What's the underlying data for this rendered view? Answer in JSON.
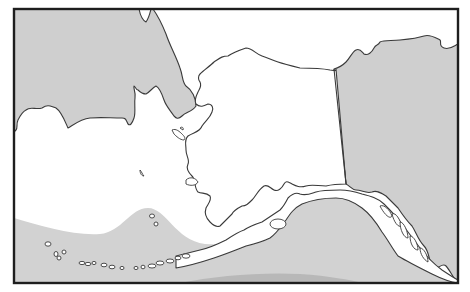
{
  "map": {
    "region": "Alaska",
    "style": "grayscale",
    "colors": {
      "background_sea": "#ffffff",
      "other_land": "#cfcfcf",
      "alaska_land": "#ffffff",
      "shaded_ocean_zone": "#d2d2d2",
      "darker_band": "#b8b8b8",
      "outline": "#3a3a3a",
      "frame": "#1e1e1e"
    },
    "features": [
      {
        "name": "russia-chukotka",
        "type": "foreign-land",
        "shade": "gray"
      },
      {
        "name": "canada-yukon-bc",
        "type": "foreign-land",
        "shade": "gray"
      },
      {
        "name": "alaska-mainland",
        "type": "land",
        "shade": "white"
      },
      {
        "name": "aleutian-islands",
        "type": "island-chain"
      },
      {
        "name": "pribilof-islands",
        "type": "islands"
      },
      {
        "name": "st-lawrence-island",
        "type": "island"
      },
      {
        "name": "shaded-ocean-zone",
        "type": "ocean-area",
        "location": "North Pacific / Gulf of Alaska"
      }
    ]
  }
}
